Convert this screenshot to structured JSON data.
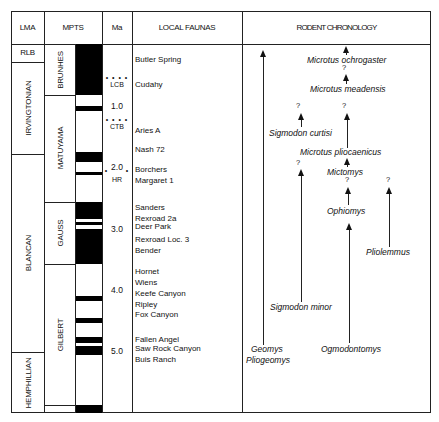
{
  "headers": {
    "lma": "LMA",
    "mpts": "MPTS",
    "ma": "Ma",
    "local_faunas": "LOCAL FAUNAS",
    "rodent_chronology": "RODENT CHRONOLOGY"
  },
  "lma_units": [
    {
      "label": "RLB",
      "top": 44,
      "bottom": 62,
      "orientation": "horizontal"
    },
    {
      "label": "IRVINGTONIAN",
      "top": 62,
      "bottom": 154,
      "orientation": "vertical"
    },
    {
      "label": "BLANCAN",
      "top": 154,
      "bottom": 352,
      "orientation": "vertical"
    },
    {
      "label": "HEMPHILLIAN",
      "top": 352,
      "bottom": 413,
      "orientation": "vertical"
    }
  ],
  "chrons": [
    {
      "label": "BRUNHES",
      "top": 44,
      "bottom": 95
    },
    {
      "label": "MATUYAMA",
      "top": 95,
      "bottom": 202
    },
    {
      "label": "GAUSS",
      "top": 202,
      "bottom": 264
    },
    {
      "label": "GILBERT",
      "top": 264,
      "bottom": 405
    }
  ],
  "ma_ticks": [
    {
      "label": "1.0",
      "y": 107
    },
    {
      "label": "2.0",
      "y": 168
    },
    {
      "label": "3.0",
      "y": 230
    },
    {
      "label": "4.0",
      "y": 291
    },
    {
      "label": "5.0",
      "y": 352
    }
  ],
  "boundaries": [
    {
      "label": "LCB",
      "y": 84
    },
    {
      "label": "CTB",
      "y": 130
    },
    {
      "label": "HR",
      "y": 180
    }
  ],
  "local_faunas": [
    {
      "name": "Butler  Spring",
      "y": 60
    },
    {
      "name": "Cudahy",
      "y": 85
    },
    {
      "name": "Aries A",
      "y": 131
    },
    {
      "name": "Nash 72",
      "y": 150
    },
    {
      "name": "Borchers",
      "y": 170
    },
    {
      "name": "Margaret  1",
      "y": 181
    },
    {
      "name": "Sanders",
      "y": 208
    },
    {
      "name": "Rexroad 2a",
      "y": 219
    },
    {
      "name": "Deer Park",
      "y": 227
    },
    {
      "name": "Rexroad Loc. 3",
      "y": 240
    },
    {
      "name": "Bender",
      "y": 251
    },
    {
      "name": "Hornet",
      "y": 272
    },
    {
      "name": "Wiens",
      "y": 283
    },
    {
      "name": "Keefe Canyon",
      "y": 294
    },
    {
      "name": "Ripley",
      "y": 305
    },
    {
      "name": "Fox Canyon",
      "y": 315
    },
    {
      "name": "Fallen Angel",
      "y": 340
    },
    {
      "name": "Saw Rock Canyon",
      "y": 349
    },
    {
      "name": "Buis Ranch",
      "y": 360
    }
  ],
  "rodent_taxa": [
    {
      "name": "Microtus  ochrogaster",
      "x": 307,
      "y": 60
    },
    {
      "name": "Microtus  meadensis",
      "x": 310,
      "y": 89
    },
    {
      "name": "Sigmodon  curtisi",
      "x": 269,
      "y": 133
    },
    {
      "name": "Microtus  pliocaenicus",
      "x": 300,
      "y": 152
    },
    {
      "name": "Mictomys",
      "x": 327,
      "y": 172
    },
    {
      "name": "Ophiomys",
      "x": 327,
      "y": 211
    },
    {
      "name": "Pliolemmus",
      "x": 366,
      "y": 252
    },
    {
      "name": "Sigmodon  minor",
      "x": 270,
      "y": 307
    },
    {
      "name": "Geomys",
      "x": 251,
      "y": 349
    },
    {
      "name": "Pliogeomys",
      "x": 246,
      "y": 360
    },
    {
      "name": "Ogmodontomys",
      "x": 321,
      "y": 349
    }
  ],
  "question_marks": [
    {
      "x": 344,
      "y": 68
    },
    {
      "x": 298,
      "y": 106
    },
    {
      "x": 344,
      "y": 106
    },
    {
      "x": 298,
      "y": 163
    },
    {
      "x": 347,
      "y": 180
    },
    {
      "x": 388,
      "y": 180
    }
  ],
  "polarity_bands_normal": [
    {
      "top": 44,
      "bottom": 95
    },
    {
      "top": 106,
      "bottom": 111
    },
    {
      "top": 152,
      "bottom": 162
    },
    {
      "top": 172,
      "bottom": 175
    },
    {
      "top": 202,
      "bottom": 219
    },
    {
      "top": 222,
      "bottom": 225
    },
    {
      "top": 229,
      "bottom": 264
    },
    {
      "top": 296,
      "bottom": 301
    },
    {
      "top": 318,
      "bottom": 323
    },
    {
      "top": 337,
      "bottom": 343
    },
    {
      "top": 346,
      "bottom": 355
    },
    {
      "top": 405,
      "bottom": 413
    }
  ]
}
